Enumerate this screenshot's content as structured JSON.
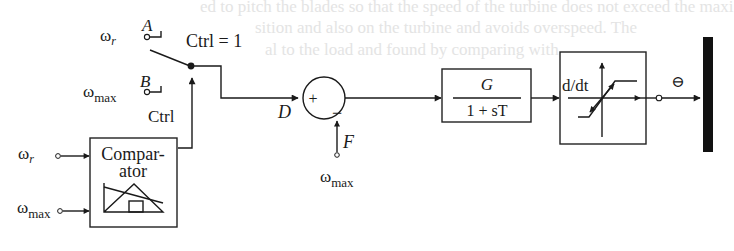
{
  "diagram": {
    "type": "control-block-diagram",
    "background_bleed_text": [
      "ed to pitch the blades so that the speed of the turbine does not exceed the maxi",
      "sition and also on the turbine and avoids overspeed. The",
      "al to the load and found by comparing with"
    ],
    "switch": {
      "input_a_signal": "ω",
      "input_a_subscript": "r",
      "input_a_label": "A",
      "input_b_signal": "ω",
      "input_b_subscript": "max",
      "input_b_label": "B",
      "condition_label": "Ctrl = 1",
      "control_label": "Ctrl"
    },
    "comparator": {
      "title_line1": "Compar-",
      "title_line2": "ator",
      "input1_signal": "ω",
      "input1_subscript": "r",
      "input2_signal": "ω",
      "input2_subscript": "max"
    },
    "summing_junction": {
      "input_label": "D",
      "plus_sign": "+",
      "minus_sign": "−",
      "feedback_label": "F",
      "feedback_signal": "ω",
      "feedback_subscript": "max"
    },
    "gain_block": {
      "numerator": "G",
      "denominator": "1 + sT"
    },
    "derivative_limiter_block": {
      "label": "d/dt"
    },
    "output": {
      "sign_symbol": "⊖"
    }
  }
}
